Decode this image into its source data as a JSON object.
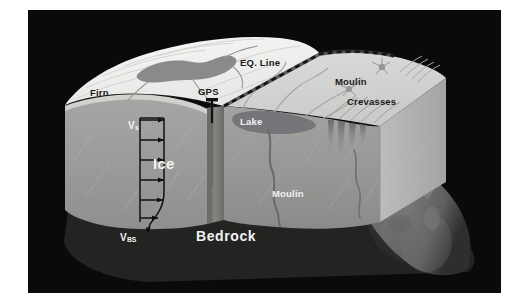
{
  "figure": {
    "kind": "glacier-block-diagram",
    "background_color": "#ffffff",
    "panel_color": "#0a0a0a"
  },
  "palette": {
    "firn_white": "#f4f4f2",
    "accumulation_surface": "#ededec",
    "ablation_surface": "#d6d6d4",
    "ice_face_light": "#a8a8a6",
    "ice_face_mid": "#9a9a98",
    "ice_face_dark": "#8c8c8a",
    "ice_side_face": "#b4b4b2",
    "supraglacial_lake": "#8a8a88",
    "bedrock_dark": "#2a2a29",
    "bedrock_ridge": "#6e6e6c",
    "eq_line": "#262626",
    "gps_pole": "#121212",
    "moulin_conduit": "#6a6a68",
    "crevasse_fill": "#77777a",
    "velocity_arrow": "#111111",
    "background": "#0a0a0a"
  },
  "labels": {
    "firn": {
      "text": "Firn",
      "color": "dark",
      "x": 62,
      "y": 84,
      "size": 9.5,
      "weight": "bold"
    },
    "gps": {
      "text": "GPS",
      "color": "dark",
      "x": 171,
      "y": 84,
      "size": 9.5,
      "weight": "bold"
    },
    "eq_line": {
      "text": "EQ. Line",
      "color": "dark",
      "x": 241,
      "y": 53,
      "size": 9.5,
      "weight": "bold"
    },
    "moulin_surface": {
      "text": "Moulin",
      "color": "dark",
      "x": 329,
      "y": 72,
      "size": 9.5,
      "weight": "bold"
    },
    "crevasses": {
      "text": "Crevasses",
      "color": "dark",
      "x": 341,
      "y": 92,
      "size": 9.5,
      "weight": "bold"
    },
    "lake": {
      "text": "Lake",
      "color": "light",
      "x": 228,
      "y": 113,
      "size": 9.5,
      "weight": "bold"
    },
    "ice": {
      "text": "Ice",
      "color": "light",
      "x": 139,
      "y": 158,
      "size": 15,
      "weight": "bold"
    },
    "moulin_interior": {
      "text": "Moulin",
      "color": "light",
      "x": 265,
      "y": 186,
      "size": 9.5,
      "weight": "bold"
    },
    "bedrock": {
      "text": "Bedrock",
      "color": "light",
      "x": 193,
      "y": 229,
      "size": 14,
      "weight": "bold"
    },
    "velocity_surface": {
      "text": "V",
      "subscript": "s",
      "color": "light",
      "x": 106,
      "y": 117,
      "size": 10,
      "weight": "bold"
    },
    "velocity_basal": {
      "text": "V",
      "subscript": "BS",
      "color": "light",
      "x": 95,
      "y": 215,
      "size": 10,
      "weight": "bold"
    }
  },
  "features": {
    "velocity_profile": {
      "name": "ice-velocity-depth-profile",
      "arrow_count": 6,
      "axis_x": 112,
      "top_y": 108,
      "bottom_y": 212,
      "arrow_length": 26
    },
    "gps_station": {
      "name": "gps-station",
      "pole_x": 184,
      "pole_top": 90,
      "pole_bottom": 112
    },
    "equilibrium_line": {
      "name": "equilibrium-line",
      "style": "dashed"
    },
    "supraglacial_lakes": 2,
    "moulins": 2,
    "crevasse_fields": 2,
    "meltwater_streams": 6
  }
}
